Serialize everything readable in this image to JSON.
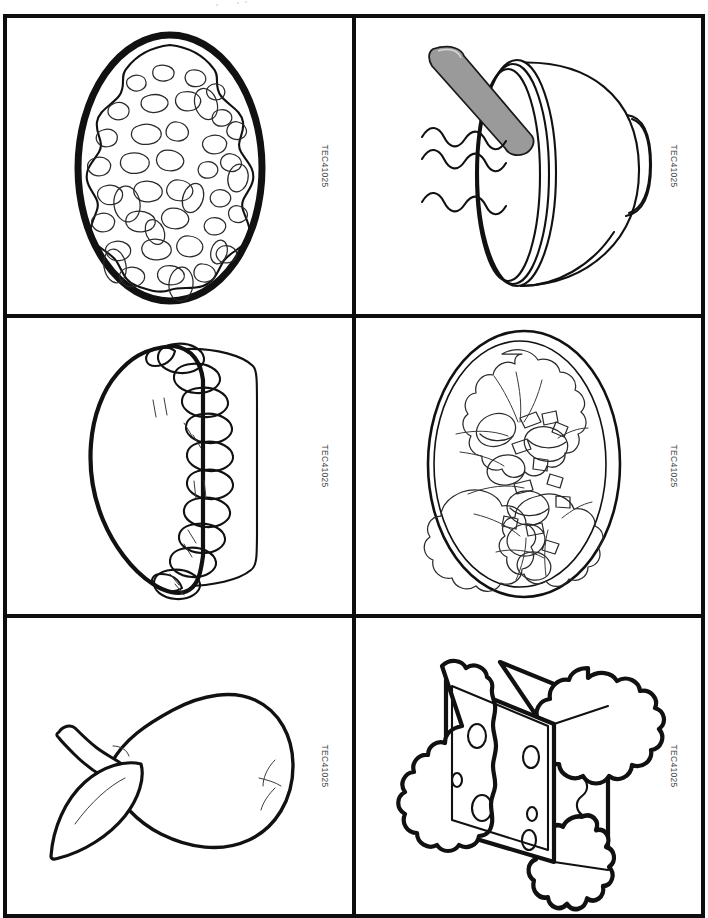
{
  "page": {
    "kind": "printable-picture-card-sheet",
    "theme": "Foods",
    "columns": 2,
    "rows": 3,
    "card_count": 6,
    "background_color": "#ffffff",
    "ink_color": "#111111",
    "accent_gray": "#9a9a9a"
  },
  "cards": [
    {
      "position": "row1-col1",
      "subject": "pizza",
      "icon": "pizza-icon",
      "code": "TEC41025",
      "description": "Whole round pizza seen from above with scattered toppings",
      "outline_style": "thick-oval-crust"
    },
    {
      "position": "row1-col2",
      "subject": "soup-bowl",
      "icon": "soup-bowl-icon",
      "code": "TEC41025",
      "description": "Bowl of hot soup with a spoon resting on the rim and three steam lines",
      "outline_style": "bowl-with-spoon",
      "spoon_color": "#9a9a9a",
      "steam_lines": 3
    },
    {
      "position": "row2-col1",
      "subject": "pie",
      "icon": "pie-icon",
      "code": "TEC41025",
      "description": "Baked pie with braided rope crust edge and vent slits",
      "outline_style": "pie-with-braided-crust",
      "vent_slit_groups": 4
    },
    {
      "position": "row2-col2",
      "subject": "salad",
      "icon": "salad-plate-icon",
      "code": "TEC41025",
      "description": "Tossed salad of lettuce leaves, tomato wedges and vegetable strips on an oval plate",
      "outline_style": "oval-plate"
    },
    {
      "position": "row3-col1",
      "subject": "pear",
      "icon": "pear-icon",
      "code": "TEC41025",
      "description": "Pear lying on its side with a stem and a single leaf",
      "outline_style": "thick-pear"
    },
    {
      "position": "row3-col2",
      "subject": "sandwich",
      "icon": "sandwich-icon",
      "code": "TEC41025",
      "description": "Stacked sandwich with ruffled lettuce and a slice of holed cheese",
      "outline_style": "layered-sandwich",
      "cheese_holes": 6
    }
  ]
}
